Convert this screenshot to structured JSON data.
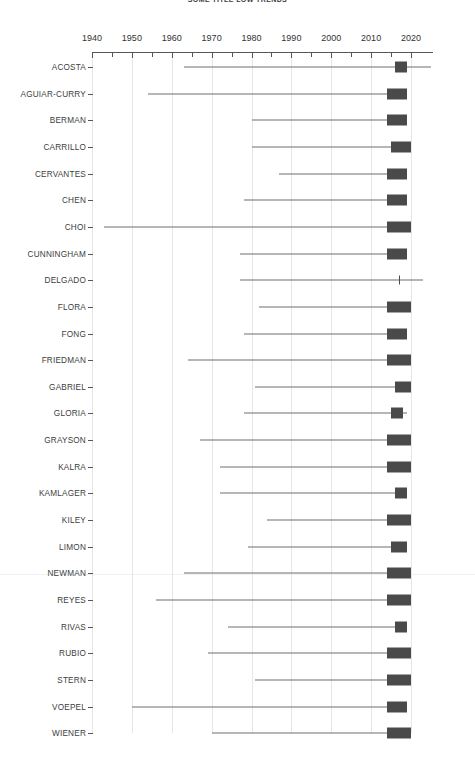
{
  "chart_title": "SOME TITLE LOW TRENDS",
  "axis": {
    "x_ticks_labeled": [
      1940,
      1950,
      1960,
      1970,
      1980,
      1990,
      2000,
      2010,
      2020
    ],
    "x_minor_step": 5,
    "x_min": 1938,
    "x_max": 2025
  },
  "chart_data": {
    "type": "bar",
    "title": "SOME TITLE LOW TRENDS",
    "xlabel": "",
    "ylabel": "",
    "xlim": [
      1938,
      2025
    ],
    "grid": true,
    "legend": false,
    "orientation": "horizontal",
    "categories": [
      "ACOSTA",
      "AGUIAR-CURRY",
      "BERMAN",
      "CARRILLO",
      "CERVANTES",
      "CHEN",
      "CHOI",
      "CUNNINGHAM",
      "DELGADO",
      "FLORA",
      "FONG",
      "FRIEDMAN",
      "GABRIEL",
      "GLORIA",
      "GRAYSON",
      "KALRA",
      "KAMLAGER",
      "KILEY",
      "LIMON",
      "NEWMAN",
      "REYES",
      "RIVAS",
      "RUBIO",
      "STERN",
      "VOEPEL",
      "WIENER"
    ],
    "x_tick_labels": [
      "1940",
      "1950",
      "1960",
      "1970",
      "1980",
      "1990",
      "2000",
      "2010",
      "2020"
    ],
    "rows": [
      {
        "name": "ACOSTA",
        "line_start": 1963,
        "line_end": 2025,
        "box_start": 2016,
        "box_end": 2019,
        "marker": false
      },
      {
        "name": "AGUIAR-CURRY",
        "line_start": 1954,
        "line_end": 2017,
        "box_start": 2014,
        "box_end": 2019,
        "marker": false
      },
      {
        "name": "BERMAN",
        "line_start": 1980,
        "line_end": 2017,
        "box_start": 2014,
        "box_end": 2019,
        "marker": false
      },
      {
        "name": "CARRILLO",
        "line_start": 1980,
        "line_end": 2017,
        "box_start": 2015,
        "box_end": 2020,
        "marker": false
      },
      {
        "name": "CERVANTES",
        "line_start": 1987,
        "line_end": 2017,
        "box_start": 2014,
        "box_end": 2019,
        "marker": false
      },
      {
        "name": "CHEN",
        "line_start": 1978,
        "line_end": 2017,
        "box_start": 2014,
        "box_end": 2019,
        "marker": false
      },
      {
        "name": "CHOI",
        "line_start": 1943,
        "line_end": 2017,
        "box_start": 2014,
        "box_end": 2020,
        "marker": false
      },
      {
        "name": "CUNNINGHAM",
        "line_start": 1977,
        "line_end": 2017,
        "box_start": 2014,
        "box_end": 2019,
        "marker": false
      },
      {
        "name": "DELGADO",
        "line_start": 1977,
        "line_end": 2023,
        "box_start": 2017,
        "box_end": 2017,
        "marker": true
      },
      {
        "name": "FLORA",
        "line_start": 1982,
        "line_end": 2017,
        "box_start": 2014,
        "box_end": 2020,
        "marker": false
      },
      {
        "name": "FONG",
        "line_start": 1978,
        "line_end": 2017,
        "box_start": 2014,
        "box_end": 2019,
        "marker": false
      },
      {
        "name": "FRIEDMAN",
        "line_start": 1964,
        "line_end": 2017,
        "box_start": 2014,
        "box_end": 2020,
        "marker": false
      },
      {
        "name": "GABRIEL",
        "line_start": 1981,
        "line_end": 2019,
        "box_start": 2016,
        "box_end": 2020,
        "marker": false
      },
      {
        "name": "GLORIA",
        "line_start": 1978,
        "line_end": 2019,
        "box_start": 2015,
        "box_end": 2018,
        "marker": false
      },
      {
        "name": "GRAYSON",
        "line_start": 1967,
        "line_end": 2017,
        "box_start": 2014,
        "box_end": 2020,
        "marker": false
      },
      {
        "name": "KALRA",
        "line_start": 1972,
        "line_end": 2017,
        "box_start": 2014,
        "box_end": 2020,
        "marker": false
      },
      {
        "name": "KAMLAGER",
        "line_start": 1972,
        "line_end": 2019,
        "box_start": 2016,
        "box_end": 2019,
        "marker": false
      },
      {
        "name": "KILEY",
        "line_start": 1984,
        "line_end": 2017,
        "box_start": 2014,
        "box_end": 2020,
        "marker": false
      },
      {
        "name": "LIMON",
        "line_start": 1979,
        "line_end": 2017,
        "box_start": 2015,
        "box_end": 2019,
        "marker": false
      },
      {
        "name": "NEWMAN",
        "line_start": 1963,
        "line_end": 2017,
        "box_start": 2014,
        "box_end": 2020,
        "marker": false
      },
      {
        "name": "REYES",
        "line_start": 1956,
        "line_end": 2017,
        "box_start": 2014,
        "box_end": 2020,
        "marker": false
      },
      {
        "name": "RIVAS",
        "line_start": 1974,
        "line_end": 2019,
        "box_start": 2016,
        "box_end": 2019,
        "marker": false
      },
      {
        "name": "RUBIO",
        "line_start": 1969,
        "line_end": 2017,
        "box_start": 2014,
        "box_end": 2020,
        "marker": false
      },
      {
        "name": "STERN",
        "line_start": 1981,
        "line_end": 2017,
        "box_start": 2014,
        "box_end": 2020,
        "marker": false
      },
      {
        "name": "VOEPEL",
        "line_start": 1950,
        "line_end": 2017,
        "box_start": 2014,
        "box_end": 2019,
        "marker": false
      },
      {
        "name": "WIENER",
        "line_start": 1970,
        "line_end": 2017,
        "box_start": 2014,
        "box_end": 2020,
        "marker": false
      }
    ]
  },
  "colors": {
    "box": "#4a4a4a",
    "line": "#6f6f6f",
    "axis": "#555555",
    "grid": "#e6e6e6",
    "text": "#3d3d3d",
    "background": "#ffffff"
  }
}
